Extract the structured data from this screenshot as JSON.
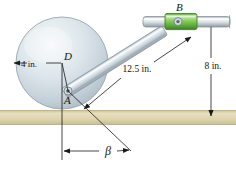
{
  "figure": {
    "type": "engineering-mechanism-diagram",
    "background_color": "#ffffff"
  },
  "ground": {
    "name": "ground-surface",
    "color_top": "#cfc6a0",
    "color_mid": "#e4dcb9",
    "color_bottom": "#cdc49c",
    "y": 110,
    "height": 15
  },
  "disk": {
    "name": "rolling-disk",
    "center_x": 62,
    "center_y": 63,
    "radius": 46,
    "fill_light": "#f2f6f8",
    "fill_mid": "#ccd7de",
    "fill_dark": "#aebcc6",
    "stroke": "#9aa7b0"
  },
  "points": {
    "D": {
      "label": "D",
      "x": 62,
      "y": 63
    },
    "A": {
      "label": "A",
      "x": 68,
      "y": 91
    },
    "B": {
      "label": "B",
      "x": 178,
      "y": 22
    }
  },
  "rod": {
    "name": "connecting-rod-AB",
    "fill_light": "#eef2f5",
    "fill_mid": "#c3ced6",
    "fill_dark": "#9fadb8",
    "stroke": "#8e9ba5"
  },
  "collar": {
    "name": "collar-B",
    "fill_light": "#d8f0c8",
    "fill_mid": "#7cc24f",
    "fill_dark": "#4e9a32",
    "stroke": "#3f7f28",
    "x": 165,
    "y": 14,
    "width": 32,
    "height": 15
  },
  "guide_rod": {
    "name": "horizontal-guide-rod",
    "fill_light": "#f4f6f7",
    "fill_mid": "#c8d0d5",
    "fill_dark": "#9aa4ab",
    "stroke": "#8b959c",
    "x_start": 143,
    "x_end": 231,
    "y": 17,
    "height": 10
  },
  "dimensions": {
    "radius": {
      "name": "radius-dimension",
      "label": "4 in.",
      "x": 30,
      "y": 66
    },
    "rod_length": {
      "name": "rod-length-dimension",
      "label": "12.5 in.",
      "x": 136,
      "y": 72
    },
    "height": {
      "name": "height-dimension",
      "label": "8 in.",
      "x": 213,
      "y": 66
    },
    "angle": {
      "name": "angle-dimension",
      "label": "β",
      "x": 108,
      "y": 155
    }
  },
  "line_color": "#1a1a1a"
}
